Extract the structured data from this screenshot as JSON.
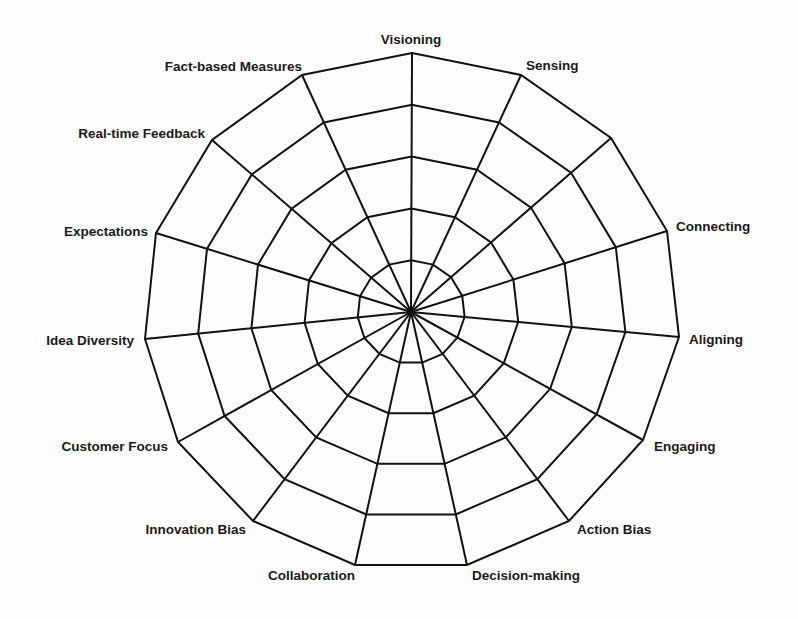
{
  "diagram": {
    "type": "spider-web / radar grid (empty)",
    "center": [
      411,
      312
    ],
    "rings": 5,
    "line_color": "#111111",
    "background": "#fdfdfd",
    "vertices": [
      {
        "label": "Visioning",
        "x": 412,
        "y": 53,
        "lx": 411,
        "ly": 40,
        "align": "center"
      },
      {
        "label": "Sensing",
        "x": 521,
        "y": 75,
        "lx": 526,
        "ly": 66,
        "align": "right"
      },
      {
        "label": "",
        "x": 611,
        "y": 138,
        "lx": 0,
        "ly": 0,
        "align": "none"
      },
      {
        "label": "Connecting",
        "x": 667,
        "y": 231,
        "lx": 676,
        "ly": 227,
        "align": "right"
      },
      {
        "label": "Aligning",
        "x": 679,
        "y": 337,
        "lx": 689,
        "ly": 340,
        "align": "right"
      },
      {
        "label": "Engaging",
        "x": 643,
        "y": 440,
        "lx": 654,
        "ly": 447,
        "align": "right"
      },
      {
        "label": "Action Bias",
        "x": 569,
        "y": 521,
        "lx": 577,
        "ly": 530,
        "align": "right"
      },
      {
        "label": "Decision-making",
        "x": 467,
        "y": 565,
        "lx": 472,
        "ly": 576,
        "align": "right"
      },
      {
        "label": "Collaboration",
        "x": 355,
        "y": 565,
        "lx": 355,
        "ly": 576,
        "align": "left"
      },
      {
        "label": "Innovation Bias",
        "x": 253,
        "y": 521,
        "lx": 246,
        "ly": 530,
        "align": "left"
      },
      {
        "label": "Customer Focus",
        "x": 178,
        "y": 442,
        "lx": 168,
        "ly": 447,
        "align": "left"
      },
      {
        "label": "Idea Diversity",
        "x": 145,
        "y": 339,
        "lx": 134,
        "ly": 341,
        "align": "left"
      },
      {
        "label": "Expectations",
        "x": 156,
        "y": 233,
        "lx": 148,
        "ly": 232,
        "align": "left"
      },
      {
        "label": "Real-time Feedback",
        "x": 212,
        "y": 140,
        "lx": 205,
        "ly": 134,
        "align": "left"
      },
      {
        "label": "Fact-based Measures",
        "x": 302,
        "y": 75,
        "lx": 302,
        "ly": 67,
        "align": "left"
      }
    ]
  }
}
